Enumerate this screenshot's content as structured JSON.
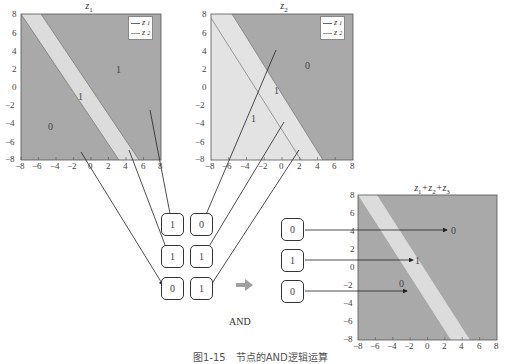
{
  "plots": {
    "z1": {
      "title": "z",
      "title_sub": "1",
      "legend": [
        {
          "label": "z",
          "sub": "1"
        },
        {
          "label": "z",
          "sub": "2"
        }
      ],
      "x_ticks": [
        "−8",
        "−6",
        "−4",
        "−2",
        "0",
        "2",
        "4",
        "6",
        "8"
      ],
      "y_ticks": [
        "8",
        "6",
        "4",
        "2",
        "0",
        "−2",
        "−4",
        "−6",
        "−8"
      ],
      "region_labels": [
        "1",
        "1",
        "0"
      ]
    },
    "z2": {
      "title": "z",
      "title_sub": "2",
      "legend": [
        {
          "label": "z",
          "sub": "1"
        },
        {
          "label": "z",
          "sub": "2"
        }
      ],
      "x_ticks": [
        "−8",
        "−6",
        "−4",
        "−2",
        "0",
        "2",
        "4",
        "6",
        "8"
      ],
      "y_ticks": [
        "8",
        "6",
        "4",
        "2",
        "0",
        "−2",
        "−4",
        "−6",
        "−8"
      ],
      "region_labels": [
        "0",
        "1",
        "1"
      ]
    },
    "sum": {
      "title": "z1+z2+z3",
      "title_parts": [
        {
          "t": "z",
          "s": "1"
        },
        {
          "t": "+z",
          "s": "2"
        },
        {
          "t": "+z",
          "s": "3"
        }
      ],
      "x_ticks": [
        "−8",
        "−6",
        "−4",
        "−2",
        "0",
        "2",
        "4",
        "6",
        "8"
      ],
      "y_ticks": [
        "8",
        "6",
        "4",
        "2",
        "0",
        "−2",
        "−4",
        "−6",
        "−8"
      ],
      "region_labels": [
        "0",
        "1",
        "0"
      ]
    }
  },
  "input_grid": {
    "rows": [
      [
        "1",
        "0"
      ],
      [
        "1",
        "1"
      ],
      [
        "0",
        "1"
      ]
    ]
  },
  "output_column": [
    "0",
    "1",
    "0"
  ],
  "operator": {
    "arrow": "➡",
    "label": "AND"
  },
  "caption": "图1-15　节点的AND逻辑运算",
  "colors": {
    "dark_region": "#a9a9a9",
    "light_region": "#d9d9d9",
    "lighter_region": "#e3e3e3",
    "line": "#333333",
    "arrow_gray": "#a0a0a0"
  }
}
